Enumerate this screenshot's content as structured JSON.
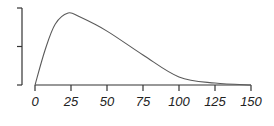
{
  "chart_data": {
    "type": "line",
    "title": "",
    "xlabel": "",
    "ylabel": "",
    "xlim": [
      0,
      150
    ],
    "ylim": [
      0,
      2
    ],
    "grid": false,
    "legend": null,
    "x_ticks": [
      0,
      25,
      50,
      75,
      100,
      125,
      150
    ],
    "x_tick_labels": [
      "0",
      "25",
      "50",
      "75",
      "100",
      "125",
      "150"
    ],
    "y_ticks": [
      0,
      1,
      2
    ],
    "y_tick_labels": [
      "",
      "",
      ""
    ],
    "series": [
      {
        "name": "density",
        "color": "#5a5a5a",
        "x": [
          0,
          7,
          14,
          23,
          31,
          50,
          75,
          100,
          125,
          150
        ],
        "y": [
          0.0,
          0.91,
          1.58,
          1.87,
          1.77,
          1.4,
          0.78,
          0.21,
          0.05,
          0.0
        ]
      }
    ]
  }
}
